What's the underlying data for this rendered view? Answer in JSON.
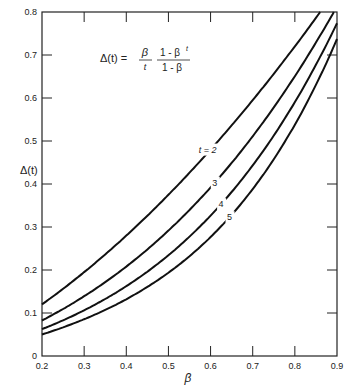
{
  "chart_data": {
    "type": "line",
    "title": "",
    "formula": {
      "lhs": "Δ(t) =",
      "num1": "β",
      "den1": "t",
      "num2": "1 - β",
      "num2_sup": "t",
      "den2": "1 - β"
    },
    "xlabel": "β",
    "ylabel": "Δ(t)",
    "xlim": [
      0.2,
      0.9
    ],
    "ylim": [
      0,
      0.8
    ],
    "xticks": [
      "0.2",
      "0.3",
      "0.4",
      "0.5",
      "0.6",
      "0.7",
      "0.8",
      "0.9"
    ],
    "yticks": [
      "0",
      "0.1",
      "0.2",
      "0.3",
      "0.4",
      "0.5",
      "0.6",
      "0.7",
      "0.8"
    ],
    "grid": false,
    "x": [
      0.2,
      0.3,
      0.4,
      0.5,
      0.6,
      0.7,
      0.8,
      0.9
    ],
    "series": [
      {
        "name": "t = 2",
        "t": 2,
        "values": [
          0.12,
          0.195,
          0.28,
          0.375,
          0.48,
          0.595,
          0.72,
          0.855
        ],
        "label": "t = 2",
        "label_beta": 0.6
      },
      {
        "name": "3",
        "t": 3,
        "values": [
          0.083,
          0.139,
          0.208,
          0.292,
          0.392,
          0.506,
          0.651,
          0.813
        ],
        "label": "3",
        "label_beta": 0.61
      },
      {
        "name": "4",
        "t": 4,
        "values": [
          0.062,
          0.106,
          0.162,
          0.234,
          0.326,
          0.441,
          0.59,
          0.774
        ],
        "label": "4",
        "label_beta": 0.625
      },
      {
        "name": "5",
        "t": 5,
        "values": [
          0.05,
          0.084,
          0.131,
          0.194,
          0.279,
          0.391,
          0.538,
          0.737
        ],
        "label": "5",
        "label_beta": 0.645
      }
    ]
  }
}
